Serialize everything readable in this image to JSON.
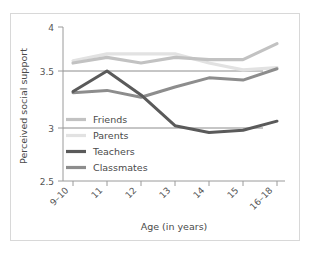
{
  "chart_data": {
    "type": "line",
    "title": "",
    "xlabel": "Age (in years)",
    "ylabel": "Perceived social support",
    "categories": [
      "9–10",
      "11",
      "12",
      "13",
      "14",
      "15",
      "16–18"
    ],
    "ylim": [
      2.5,
      4.0
    ],
    "yticks": [
      2.5,
      3,
      3.5,
      4
    ],
    "ytick_labels": [
      "2.5",
      "3",
      "3.5",
      "4"
    ],
    "gridlines": [
      3.0,
      3.5
    ],
    "grid": true,
    "legend_position": "inside-left-middle",
    "series": [
      {
        "name": "Friends",
        "color": "#c2c2c2",
        "values": [
          3.57,
          3.62,
          3.57,
          3.62,
          3.6,
          3.6,
          3.74
        ]
      },
      {
        "name": "Parents",
        "color": "#e2e2e2",
        "values": [
          3.59,
          3.65,
          3.65,
          3.65,
          3.57,
          3.51,
          3.53
        ]
      },
      {
        "name": "Teachers",
        "color": "#5a5a5a",
        "values": [
          3.32,
          3.5,
          3.29,
          3.02,
          2.96,
          2.98,
          3.06
        ]
      },
      {
        "name": "Classmates",
        "color": "#8d8d8d",
        "values": [
          3.31,
          3.33,
          3.27,
          3.36,
          3.44,
          3.42,
          3.52
        ]
      }
    ]
  },
  "axes": {
    "y_title": "Perceived social support",
    "x_title": "Age (in years)",
    "y_tick_0": "2.5",
    "y_tick_1": "3",
    "y_tick_2": "3.5",
    "y_tick_3": "4",
    "x_tick_0": "9–10",
    "x_tick_1": "11",
    "x_tick_2": "12",
    "x_tick_3": "13",
    "x_tick_4": "14",
    "x_tick_5": "15",
    "x_tick_6": "16–18"
  },
  "legend": {
    "items": [
      {
        "label": "Friends",
        "color": "#c2c2c2"
      },
      {
        "label": "Parents",
        "color": "#e2e2e2"
      },
      {
        "label": "Teachers",
        "color": "#5a5a5a"
      },
      {
        "label": "Classmates",
        "color": "#8d8d8d"
      }
    ]
  },
  "colors": {
    "frame_border": "#d8d8d8",
    "axis": "#9a9a9a",
    "grid": "#6f6f6f",
    "text": "#4a4a4a",
    "background": "#ffffff"
  }
}
